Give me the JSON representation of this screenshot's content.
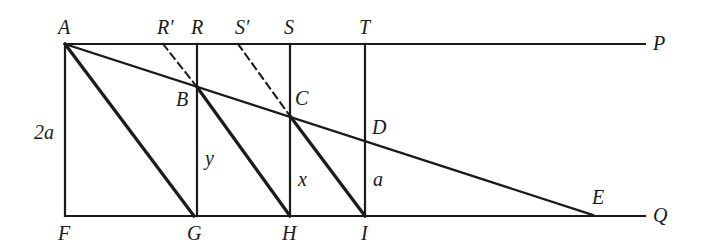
{
  "diagram": {
    "points": {
      "A": {
        "label": "A",
        "x": 65,
        "y": 44
      },
      "R_prime": {
        "label": "R′",
        "x": 163,
        "y": 44
      },
      "R": {
        "label": "R",
        "x": 197,
        "y": 44
      },
      "S_prime": {
        "label": "S′",
        "x": 238,
        "y": 44
      },
      "S": {
        "label": "S",
        "x": 290,
        "y": 44
      },
      "T": {
        "label": "T",
        "x": 365,
        "y": 44
      },
      "P": {
        "label": "P",
        "x": 645,
        "y": 44
      },
      "B": {
        "label": "B",
        "x": 197,
        "y": 87
      },
      "C": {
        "label": "C",
        "x": 290,
        "y": 116
      },
      "D": {
        "label": "D",
        "x": 365,
        "y": 140
      },
      "E": {
        "label": "E",
        "x": 593,
        "y": 215
      },
      "F": {
        "label": "F",
        "x": 65,
        "y": 216
      },
      "G": {
        "label": "G",
        "x": 195,
        "y": 216
      },
      "H": {
        "label": "H",
        "x": 290,
        "y": 216
      },
      "I": {
        "label": "I",
        "x": 365,
        "y": 216
      },
      "Q": {
        "label": "Q",
        "x": 645,
        "y": 216
      }
    },
    "measures": {
      "AF": "2a",
      "RG": "y",
      "SH": "x",
      "TI": "a"
    }
  }
}
